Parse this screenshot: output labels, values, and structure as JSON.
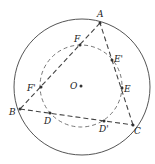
{
  "diagram": {
    "type": "geometry",
    "colors": {
      "stroke": "#555555",
      "point": "#333333",
      "label": "#222222",
      "background": "#ffffff"
    },
    "outer_circle": {
      "cx": 82,
      "cy": 87,
      "r": 68
    },
    "inner_circle": {
      "cx": 81,
      "cy": 86,
      "r": 41
    },
    "points": {
      "A": {
        "label": "A",
        "x": 100,
        "y": 23,
        "lx": 97,
        "ly": 17
      },
      "B": {
        "label": "B",
        "x": 20,
        "y": 109,
        "lx": 9,
        "ly": 115
      },
      "C": {
        "label": "C",
        "x": 133,
        "y": 125,
        "lx": 134,
        "ly": 134
      },
      "F": {
        "label": "F",
        "x": 80,
        "y": 45,
        "lx": 74,
        "ly": 42
      },
      "E2": {
        "label": "E'",
        "x": 112,
        "y": 60,
        "lx": 114,
        "ly": 62
      },
      "E": {
        "label": "E",
        "x": 122,
        "y": 88,
        "lx": 124,
        "ly": 92
      },
      "F2": {
        "label": "F'",
        "x": 41,
        "y": 87,
        "lx": 27,
        "ly": 91
      },
      "D": {
        "label": "D",
        "x": 50,
        "y": 113,
        "lx": 44,
        "ly": 124
      },
      "D2": {
        "label": "D'",
        "x": 104,
        "y": 121,
        "lx": 99,
        "ly": 132
      },
      "O": {
        "label": "O",
        "x": 81,
        "y": 86,
        "lx": 70,
        "ly": 89
      }
    },
    "segments": [
      {
        "from": "A",
        "to": "B",
        "style": "dashed"
      },
      {
        "from": "B",
        "to": "C",
        "style": "dashed"
      },
      {
        "from": "C",
        "to": "A",
        "style": "dashed"
      }
    ]
  }
}
